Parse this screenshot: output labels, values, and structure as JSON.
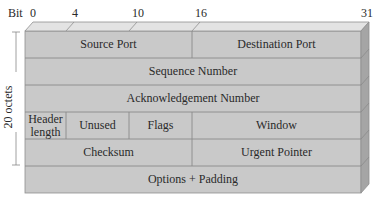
{
  "diagram": {
    "bit_axis": {
      "label": "Bit",
      "ticks": [
        {
          "value": "0",
          "x": 30
        },
        {
          "value": "4",
          "x": 72
        },
        {
          "value": "10",
          "x": 135
        },
        {
          "value": "16",
          "x": 197
        },
        {
          "value": "31",
          "x": 364
        }
      ]
    },
    "size_annotation": "20 octets",
    "rows": [
      {
        "fields": [
          {
            "label": "Source Port",
            "bits": "0-15"
          },
          {
            "label": "Destination Port",
            "bits": "16-31"
          }
        ]
      },
      {
        "fields": [
          {
            "label": "Sequence Number",
            "bits": "0-31"
          }
        ]
      },
      {
        "fields": [
          {
            "label": "Acknowledgement Number",
            "bits": "0-31"
          }
        ]
      },
      {
        "fields": [
          {
            "label": "Header length",
            "bits": "0-3"
          },
          {
            "label": "Unused",
            "bits": "4-9"
          },
          {
            "label": "Flags",
            "bits": "10-15"
          },
          {
            "label": "Window",
            "bits": "16-31"
          }
        ]
      },
      {
        "fields": [
          {
            "label": "Checksum",
            "bits": "0-15"
          },
          {
            "label": "Urgent Pointer",
            "bits": "16-31"
          }
        ]
      },
      {
        "fields": [
          {
            "label": "Options + Padding",
            "bits": "0-31"
          }
        ]
      }
    ],
    "colors": {
      "front": "#c9c9c9",
      "top": "#e2e2e2",
      "side": "#a6a6a6",
      "line": "#8a8a8a"
    }
  }
}
